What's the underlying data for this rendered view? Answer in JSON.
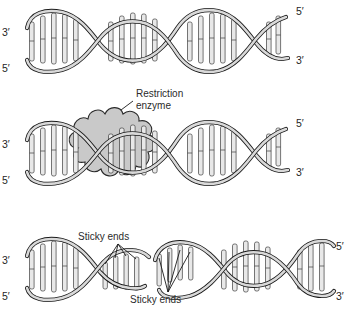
{
  "figure": {
    "background_color": "#ffffff",
    "ink_color": "#1a1a1a",
    "backbone_fill": "#d9d9d9",
    "backbone_stroke": "#1a1a1a",
    "rung_fill": "#e6e6e6",
    "rung_stroke": "#3a3a3a",
    "enzyme_fill": "#c9c9c9",
    "enzyme_stroke": "#2a2a2a"
  },
  "panels": [
    {
      "id": "panel-intact-dna",
      "name": "Intact DNA double helix",
      "labels": {
        "left_top": "3′",
        "left_bottom": "5′",
        "right_top": "5′",
        "right_bottom": "3′"
      }
    },
    {
      "id": "panel-enzyme-bound",
      "name": "Restriction enzyme bound to DNA",
      "callout": {
        "line1": "Restriction",
        "line2": "enzyme"
      },
      "labels": {
        "left_top": "3′",
        "left_bottom": "5′",
        "right_top": "5′",
        "right_bottom": "3′"
      }
    },
    {
      "id": "panel-cut-fragments",
      "name": "Cut DNA fragments with sticky ends",
      "callout_left": "Sticky ends",
      "callout_right": "Sticky ends",
      "labels": {
        "left_top": "3′",
        "left_bottom": "5′",
        "right_top": "5′",
        "right_bottom": "3′"
      }
    }
  ]
}
